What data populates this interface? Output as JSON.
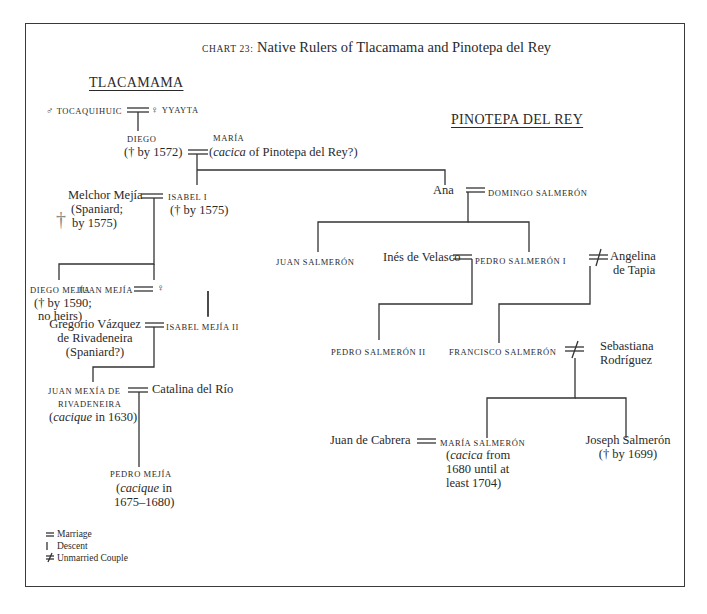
{
  "chart": {
    "label": "CHART 23:",
    "title": "Native Rulers of Tlacamama and Pinotepa del Rey"
  },
  "regions": {
    "tlacamama": "TLACAMAMA",
    "pinotepa": "PINOTEPA DEL REY"
  },
  "symbols": {
    "male": "♂",
    "female": "♀",
    "marriage": "=",
    "unmarried": "≠",
    "dagger": "†"
  },
  "people": {
    "tocaquihuic": "TOCAQUIHUIC",
    "yyayta": "YYAYTA",
    "diego": "DIEGO",
    "diego_note": "(† by 1572)",
    "maria": "MARÍA",
    "maria_note_italic": "cacica",
    "maria_note_rest": " of Pinotepa del Rey?)",
    "maria_note_open": "(",
    "melchor": "Melchor Mejía",
    "melchor_note1": "(Spaniard;",
    "melchor_note2": "by 1575)",
    "isabel1": "ISABEL I",
    "isabel1_note": "(† by 1575)",
    "diego_mejia": "DIEGO MEJÍA",
    "diego_mejia_note1": "(† by 1590;",
    "diego_mejia_note2": "no heirs)",
    "juan_mejia": "JUAN MEJÍA",
    "juan_mejia_spouse": "♀",
    "gregorio1": "Gregorio Vázquez",
    "gregorio2": "de Rivadeneira",
    "gregorio3": "(Spaniard?)",
    "isabel2": "ISABEL MEJÍA II",
    "juan_mexia1": "JUAN MEXÍA DE",
    "juan_mexia2": "RIVADENEIRA",
    "juan_mexia_note_open": "(",
    "juan_mexia_note_italic": "cacique",
    "juan_mexia_note_rest": " in 1630)",
    "catalina": "Catalina del Río",
    "pedro_mejia": "PEDRO MEJÍA",
    "pedro_mejia_note_open": "(",
    "pedro_mejia_note_italic": "cacique",
    "pedro_mejia_note_rest": " in",
    "pedro_mejia_note2": "1675–1680)",
    "ana": "Ana",
    "domingo": "DOMINGO SALMERÓN",
    "juan_salmeron": "JUAN SALMERÓN",
    "ines": "Inés de Velasco",
    "pedro1": "PEDRO SALMERÓN I",
    "angelina1": "Angelina",
    "angelina2": "de Tapia",
    "pedro2": "PEDRO SALMERÓN II",
    "francisco": "FRANCISCO SALMERÓN",
    "sebastiana1": "Sebastiana",
    "sebastiana2": "Rodríguez",
    "cabrera": "Juan de Cabrera",
    "maria_salmeron": "MARÍA SALMERÓN",
    "maria_salmeron_note_open": "(",
    "maria_salmeron_note_italic": "cacica",
    "maria_salmeron_note_rest": " from",
    "maria_salmeron_note2": "1680 until at",
    "maria_salmeron_note3": "least 1704)",
    "joseph": "Joseph Salmerón",
    "joseph_note": "(† by 1699)"
  },
  "legend": [
    {
      "symbol": "=",
      "label": "Marriage"
    },
    {
      "symbol": "|",
      "label": "Descent"
    },
    {
      "symbol": "≠",
      "label": "Unmarried Couple"
    }
  ]
}
